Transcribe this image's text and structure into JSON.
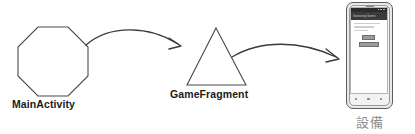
{
  "diagram": {
    "type": "flow-diagram",
    "background_color": "#ffffff",
    "stroke_color": "#4a4a4a",
    "nodes": [
      {
        "id": "main-activity",
        "shape": "octagon",
        "label": "MainActivity",
        "label_color": "#1a1a1a"
      },
      {
        "id": "game-fragment",
        "shape": "triangle",
        "label": "GameFragment",
        "label_color": "#1a1a1a"
      },
      {
        "id": "device",
        "shape": "smartphone",
        "label": "設備",
        "label_color": "#8d8d8d"
      }
    ],
    "arrows": [
      {
        "id": "arrow-activity-to-fragment",
        "from": "main-activity",
        "to": "game-fragment",
        "style": "curved",
        "color": "#3a3a3a"
      },
      {
        "id": "arrow-fragment-to-device",
        "from": "game-fragment",
        "to": "device",
        "style": "curved",
        "color": "#3a3a3a"
      }
    ]
  },
  "phone": {
    "app_bar_title": "Guessing Game",
    "status_bar_color": "#2b2b2b",
    "app_bar_color": "#3a3a3a",
    "screen_background": "#ffffff",
    "content_lines": [
      "",
      "",
      ""
    ],
    "buttons": [
      {
        "id": "screen-primary-button",
        "label": ""
      },
      {
        "id": "screen-secondary-button",
        "label": ""
      }
    ],
    "nav_keys": [
      "back-key",
      "home-key",
      "recents-key"
    ]
  }
}
